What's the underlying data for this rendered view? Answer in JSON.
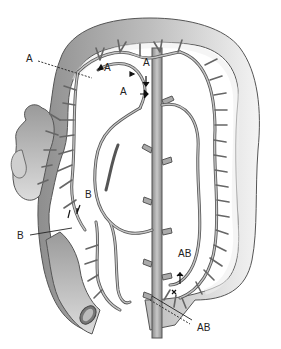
{
  "figure": {
    "colors": {
      "bowel_fill": "#9a9a9a",
      "bowel_light": "#e6e6e6",
      "vessel_fill": "#b5b5b5",
      "vessel_outline": "#555555",
      "label_text": "#222222"
    },
    "labels": [
      {
        "id": "A-left-pointer",
        "text": "A"
      },
      {
        "id": "A-upper-left",
        "text": "A"
      },
      {
        "id": "A-upper-right",
        "text": "A"
      },
      {
        "id": "A-middle",
        "text": "A"
      },
      {
        "id": "B-upper",
        "text": "B"
      },
      {
        "id": "B-left-pointer",
        "text": "B"
      },
      {
        "id": "AB-upper",
        "text": "AB"
      },
      {
        "id": "AB-lower-pointer",
        "text": "AB"
      }
    ],
    "caption": ""
  }
}
